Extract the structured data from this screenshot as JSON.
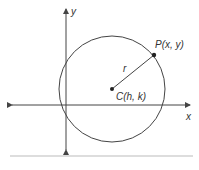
{
  "diagram": {
    "labels": {
      "y_axis": "y",
      "x_axis": "x",
      "point": "P(x, y)",
      "center": "C(h, k)",
      "radius": "r"
    },
    "colors": {
      "stroke": "#444444",
      "rule": "#bbbbbb"
    }
  }
}
